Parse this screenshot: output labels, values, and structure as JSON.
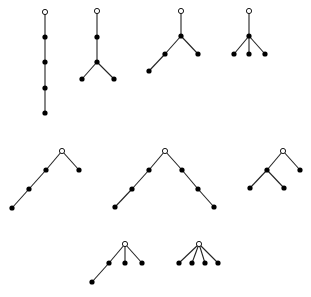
{
  "figure": {
    "colors": {
      "edge": "#222222",
      "filled_node": "#000000",
      "root_fill": "#ffffff",
      "background": "#ffffff"
    },
    "node_radius": 2.6,
    "root_radius": 2.6,
    "trees": [
      {
        "id": "tree-1",
        "nodes": [
          [
            45,
            12
          ],
          [
            45,
            37
          ],
          [
            45,
            62
          ],
          [
            45,
            88
          ],
          [
            45,
            113
          ]
        ],
        "edges": [
          [
            0,
            1
          ],
          [
            1,
            2
          ],
          [
            2,
            3
          ],
          [
            3,
            4
          ]
        ]
      },
      {
        "id": "tree-2",
        "nodes": [
          [
            97,
            11
          ],
          [
            97,
            37
          ],
          [
            97,
            62
          ],
          [
            82,
            79
          ],
          [
            114,
            79
          ]
        ],
        "edges": [
          [
            0,
            1
          ],
          [
            1,
            2
          ],
          [
            2,
            3
          ],
          [
            2,
            4
          ]
        ]
      },
      {
        "id": "tree-3",
        "nodes": [
          [
            181,
            11
          ],
          [
            181,
            36
          ],
          [
            165,
            54
          ],
          [
            149,
            71
          ],
          [
            198,
            54
          ]
        ],
        "edges": [
          [
            0,
            1
          ],
          [
            1,
            2
          ],
          [
            2,
            3
          ],
          [
            1,
            4
          ]
        ]
      },
      {
        "id": "tree-4",
        "nodes": [
          [
            249,
            11
          ],
          [
            249,
            36
          ],
          [
            234,
            54
          ],
          [
            249,
            54
          ],
          [
            265,
            54
          ]
        ],
        "edges": [
          [
            0,
            1
          ],
          [
            1,
            2
          ],
          [
            1,
            3
          ],
          [
            1,
            4
          ]
        ]
      },
      {
        "id": "tree-5",
        "nodes": [
          [
            62,
            151
          ],
          [
            46,
            170
          ],
          [
            29,
            189
          ],
          [
            12,
            208
          ],
          [
            79,
            170
          ]
        ],
        "edges": [
          [
            0,
            1
          ],
          [
            1,
            2
          ],
          [
            2,
            3
          ],
          [
            0,
            4
          ]
        ]
      },
      {
        "id": "tree-6",
        "nodes": [
          [
            165,
            151
          ],
          [
            149,
            170
          ],
          [
            132,
            189
          ],
          [
            115,
            207
          ],
          [
            182,
            170
          ],
          [
            198,
            189
          ],
          [
            214,
            207
          ]
        ],
        "edges": [
          [
            0,
            1
          ],
          [
            1,
            2
          ],
          [
            2,
            3
          ],
          [
            0,
            4
          ],
          [
            4,
            5
          ],
          [
            5,
            6
          ]
        ]
      },
      {
        "id": "tree-7",
        "nodes": [
          [
            283,
            151
          ],
          [
            267,
            170
          ],
          [
            250,
            188
          ],
          [
            284,
            188
          ],
          [
            300,
            170
          ]
        ],
        "edges": [
          [
            0,
            1
          ],
          [
            1,
            2
          ],
          [
            1,
            3
          ],
          [
            0,
            4
          ]
        ]
      },
      {
        "id": "tree-8",
        "nodes": [
          [
            125,
            244
          ],
          [
            109,
            263
          ],
          [
            92,
            282
          ],
          [
            125,
            263
          ],
          [
            142,
            263
          ]
        ],
        "edges": [
          [
            0,
            1
          ],
          [
            1,
            2
          ],
          [
            0,
            3
          ],
          [
            0,
            4
          ]
        ]
      },
      {
        "id": "tree-9",
        "nodes": [
          [
            199,
            244
          ],
          [
            179,
            263
          ],
          [
            192,
            263
          ],
          [
            205,
            263
          ],
          [
            218,
            263
          ]
        ],
        "edges": [
          [
            0,
            1
          ],
          [
            0,
            2
          ],
          [
            0,
            3
          ],
          [
            0,
            4
          ]
        ]
      }
    ]
  }
}
